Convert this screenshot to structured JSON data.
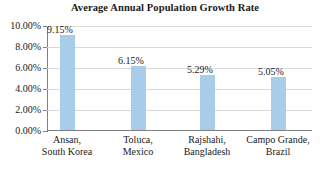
{
  "chart_data": {
    "type": "bar",
    "title": "Average Annual Population Growth Rate",
    "xlabel": "",
    "ylabel": "",
    "ylim": [
      0,
      10
    ],
    "ytick_labels": [
      "10.00%",
      "8.00%",
      "6.00%",
      "4.00%",
      "2.00%",
      "0.00%"
    ],
    "ytick_values": [
      10,
      8,
      6,
      4,
      2,
      0
    ],
    "grid": true,
    "legend": false,
    "bar_color": "#a8cdeb",
    "categories": [
      "Ansan, South Korea",
      "Toluca, Mexico",
      "Rajshahi, Bangladesh",
      "Campo Grande, Brazil"
    ],
    "category_lines": [
      [
        "Ansan,",
        "South Korea"
      ],
      [
        "Toluca,",
        "Mexico"
      ],
      [
        "Rajshahi,",
        "Bangladesh"
      ],
      [
        "Campo Grande,",
        "Brazil"
      ]
    ],
    "values": [
      9.15,
      6.15,
      5.29,
      5.05
    ],
    "value_labels": [
      "9.15%",
      "6.15%",
      "5.29%",
      "5.05%"
    ]
  }
}
